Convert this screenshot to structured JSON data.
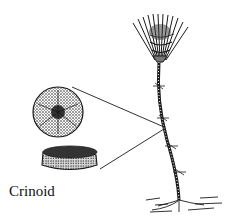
{
  "figure": {
    "label": "Crinoid",
    "parts": [
      {
        "name": "crown",
        "description": "feathery arms at top of stalk"
      },
      {
        "name": "stalk",
        "description": "segmented stem with cirri"
      },
      {
        "name": "stem-cross-section",
        "description": "circular columnal face view"
      },
      {
        "name": "stem-columnal-side",
        "description": "disc-shaped columnal side view"
      },
      {
        "name": "holdfast",
        "description": "root-like base on substrate"
      }
    ],
    "colors": {
      "ink": "#1a1a1a",
      "background": "#ffffff"
    }
  }
}
